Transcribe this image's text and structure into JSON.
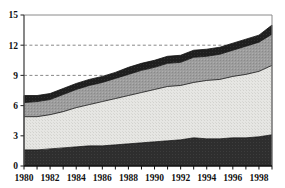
{
  "chart_data": {
    "type": "area",
    "title": "",
    "subtitle": "",
    "xlabel": "",
    "ylabel": "",
    "stacked": true,
    "grid": "horizontal-dashed-partial",
    "legend": "none",
    "xlim": [
      1980,
      1999
    ],
    "ylim": [
      0,
      15
    ],
    "yticks": [
      0,
      3,
      6,
      9,
      12,
      15
    ],
    "ytick_labels": [
      "0",
      "3",
      "6",
      "9",
      "12",
      "15"
    ],
    "gridlines": [
      9,
      12
    ],
    "x": [
      1980,
      1981,
      1982,
      1983,
      1984,
      1985,
      1986,
      1987,
      1988,
      1989,
      1990,
      1991,
      1992,
      1993,
      1994,
      1995,
      1996,
      1997,
      1998,
      1999
    ],
    "xticks": [
      1980,
      1982,
      1984,
      1986,
      1988,
      1990,
      1992,
      1994,
      1996,
      1998
    ],
    "xtick_labels": [
      "1980",
      "1982",
      "1984",
      "1986",
      "1988",
      "1990",
      "1992",
      "1994",
      "1996",
      "1998"
    ],
    "series": [
      {
        "name": "band-1-bottom",
        "color": "#2b2b2b",
        "values": [
          1.6,
          1.6,
          1.7,
          1.8,
          1.9,
          2.0,
          2.0,
          2.1,
          2.2,
          2.3,
          2.4,
          2.5,
          2.6,
          2.8,
          2.7,
          2.7,
          2.8,
          2.8,
          2.9,
          3.1
        ]
      },
      {
        "name": "band-2-light",
        "color": "#e3e3e0",
        "values": [
          3.3,
          3.3,
          3.4,
          3.6,
          3.9,
          4.1,
          4.4,
          4.6,
          4.8,
          5.0,
          5.2,
          5.4,
          5.4,
          5.5,
          5.8,
          5.9,
          6.1,
          6.3,
          6.5,
          6.9
        ]
      },
      {
        "name": "band-3-medium-gray",
        "color": "#9b9b9b",
        "values": [
          1.4,
          1.5,
          1.5,
          1.7,
          1.8,
          1.9,
          1.9,
          2.0,
          2.1,
          2.2,
          2.2,
          2.3,
          2.3,
          2.5,
          2.4,
          2.5,
          2.6,
          2.8,
          2.9,
          3.1
        ]
      },
      {
        "name": "band-4-top-dark",
        "color": "#1e1e1e",
        "values": [
          0.7,
          0.6,
          0.6,
          0.6,
          0.6,
          0.6,
          0.6,
          0.6,
          0.7,
          0.7,
          0.7,
          0.7,
          0.7,
          0.7,
          0.7,
          0.7,
          0.7,
          0.7,
          0.7,
          0.9
        ]
      }
    ],
    "cumulative_tops": {
      "band-1-bottom": [
        1.6,
        1.6,
        1.7,
        1.8,
        1.9,
        2.0,
        2.0,
        2.1,
        2.2,
        2.3,
        2.4,
        2.5,
        2.6,
        2.8,
        2.7,
        2.7,
        2.8,
        2.8,
        2.9,
        3.1
      ],
      "band-2-light": [
        4.9,
        4.9,
        5.1,
        5.4,
        5.8,
        6.1,
        6.4,
        6.7,
        7.0,
        7.3,
        7.6,
        7.9,
        8.0,
        8.3,
        8.5,
        8.6,
        8.9,
        9.1,
        9.4,
        10.0
      ],
      "band-3-medium-gray": [
        6.3,
        6.4,
        6.6,
        7.1,
        7.6,
        8.0,
        8.3,
        8.7,
        9.1,
        9.5,
        9.8,
        10.2,
        10.3,
        10.8,
        10.9,
        11.1,
        11.5,
        11.9,
        12.3,
        13.1
      ],
      "band-4-top-dark": [
        7.0,
        7.0,
        7.2,
        7.7,
        8.2,
        8.6,
        8.9,
        9.3,
        9.8,
        10.2,
        10.5,
        10.9,
        11.0,
        11.5,
        11.6,
        11.8,
        12.2,
        12.6,
        13.0,
        14.0
      ]
    }
  }
}
